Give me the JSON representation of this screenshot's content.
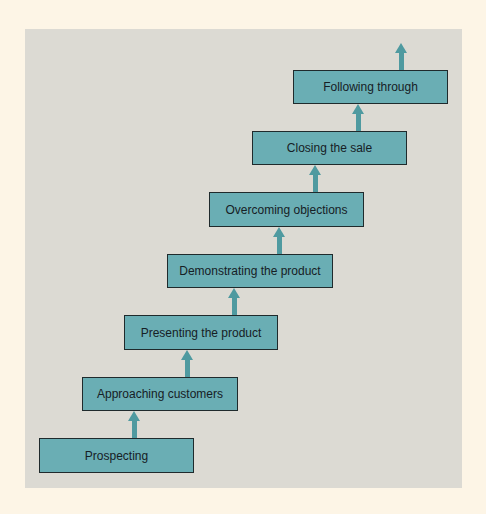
{
  "diagram": {
    "type": "staircase-flow",
    "direction": "bottom-to-top",
    "colors": {
      "background": "#fdf5e6",
      "panel": "#dcdad3",
      "box_fill": "#6aaeb4",
      "box_border": "#1f2a2c",
      "arrow": "#4f9aa0",
      "text": "#162025"
    },
    "steps": [
      {
        "label": "Prospecting"
      },
      {
        "label": "Approaching customers"
      },
      {
        "label": "Presenting the product"
      },
      {
        "label": "Demonstrating the product"
      },
      {
        "label": "Overcoming objections"
      },
      {
        "label": "Closing the sale"
      },
      {
        "label": "Following through"
      }
    ]
  }
}
